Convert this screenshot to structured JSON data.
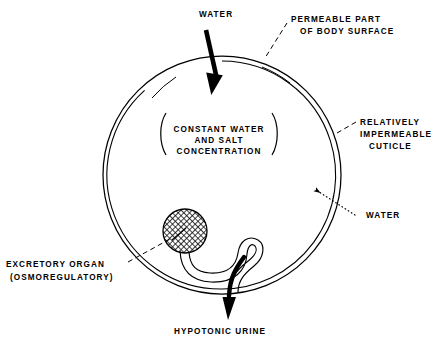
{
  "figure": {
    "type": "biological-diagram",
    "background_color": "#ffffff",
    "ink_color": "#000000"
  },
  "body_outline": {
    "name": "animal-body-circle",
    "shape": "circle",
    "center_x": 222,
    "center_y": 175,
    "outer_radius": 119,
    "inner_radius": 114,
    "wall_description": "double-line body wall"
  },
  "labels": {
    "water_in_top": "WATER",
    "permeable_part": {
      "line1": "PERMEABLE  PART",
      "line2": "OF  BODY  SURFACE"
    },
    "cuticle": {
      "line1": "RELATIVELY",
      "line2": "IMPERMEABLE",
      "line3": "CUTICLE"
    },
    "interior": {
      "line1": "CONSTANT WATER",
      "line2": "AND  SALT",
      "line3": "CONCENTRATION"
    },
    "water_in_side": "WATER",
    "excretory_organ": {
      "line1": "EXCRETORY  ORGAN",
      "line2": "(OSMOREGULATORY)"
    },
    "urine_out": "HYPOTONIC  URINE"
  },
  "arrows": [
    {
      "name": "water-influx-top-arrow",
      "style": "solid-thick",
      "label": "WATER",
      "direction": "into-body-downward"
    },
    {
      "name": "water-influx-side-arrow",
      "style": "dotted-thin",
      "label": "WATER",
      "direction": "into-body-leftward"
    },
    {
      "name": "urine-efflux-arrow",
      "style": "solid-thick-curved",
      "label": "HYPOTONIC  URINE",
      "direction": "out-of-body-downward"
    }
  ],
  "organ": {
    "name": "excretory-organ",
    "fill_pattern": "cross-hatch",
    "center_x": 185,
    "center_y": 231,
    "radius": 22,
    "tubule": "S-shaped looping duct leading to body wall"
  },
  "leader_lines": [
    {
      "name": "permeable-part-leader",
      "style": "dashed"
    },
    {
      "name": "cuticle-leader",
      "style": "dashed"
    },
    {
      "name": "excretory-organ-leader",
      "style": "dashed"
    }
  ]
}
